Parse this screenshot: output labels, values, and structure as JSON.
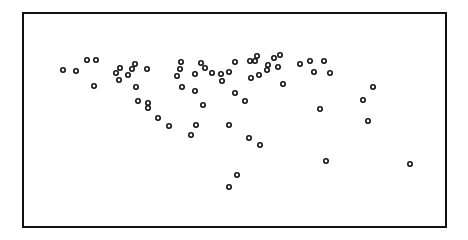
{
  "chart_data": {
    "type": "scatter",
    "title": "",
    "xlabel": "",
    "ylabel": "",
    "grid": false,
    "legend": null,
    "axes_visible": false,
    "frame": {
      "x0": 23,
      "y0": 13,
      "x1": 446,
      "y1": 227,
      "stroke": "#111111",
      "stroke_width": 2
    },
    "marker": {
      "shape": "hollow-circle",
      "radius": 2.2,
      "stroke": "#111111",
      "stroke_width": 1.6,
      "fill": "#ffffff"
    },
    "coordinate_space": "pixel (frame-relative plot, no tick labels shown)",
    "points": [
      {
        "x": 63,
        "y": 70
      },
      {
        "x": 76,
        "y": 71
      },
      {
        "x": 87,
        "y": 60
      },
      {
        "x": 96,
        "y": 60
      },
      {
        "x": 94,
        "y": 86
      },
      {
        "x": 116,
        "y": 73
      },
      {
        "x": 120,
        "y": 68
      },
      {
        "x": 119,
        "y": 80
      },
      {
        "x": 128,
        "y": 75
      },
      {
        "x": 132,
        "y": 69
      },
      {
        "x": 135,
        "y": 64
      },
      {
        "x": 147,
        "y": 69
      },
      {
        "x": 136,
        "y": 87
      },
      {
        "x": 138,
        "y": 101
      },
      {
        "x": 148,
        "y": 103
      },
      {
        "x": 148,
        "y": 108
      },
      {
        "x": 158,
        "y": 118
      },
      {
        "x": 169,
        "y": 126
      },
      {
        "x": 181,
        "y": 62
      },
      {
        "x": 180,
        "y": 69
      },
      {
        "x": 177,
        "y": 76
      },
      {
        "x": 182,
        "y": 87
      },
      {
        "x": 201,
        "y": 63
      },
      {
        "x": 205,
        "y": 68
      },
      {
        "x": 195,
        "y": 74
      },
      {
        "x": 212,
        "y": 73
      },
      {
        "x": 221,
        "y": 74
      },
      {
        "x": 222,
        "y": 81
      },
      {
        "x": 229,
        "y": 72
      },
      {
        "x": 235,
        "y": 62
      },
      {
        "x": 195,
        "y": 91
      },
      {
        "x": 203,
        "y": 105
      },
      {
        "x": 235,
        "y": 93
      },
      {
        "x": 245,
        "y": 101
      },
      {
        "x": 196,
        "y": 125
      },
      {
        "x": 191,
        "y": 135
      },
      {
        "x": 229,
        "y": 125
      },
      {
        "x": 249,
        "y": 138
      },
      {
        "x": 260,
        "y": 145
      },
      {
        "x": 237,
        "y": 175
      },
      {
        "x": 229,
        "y": 187
      },
      {
        "x": 250,
        "y": 61
      },
      {
        "x": 255,
        "y": 61
      },
      {
        "x": 257,
        "y": 56
      },
      {
        "x": 251,
        "y": 78
      },
      {
        "x": 259,
        "y": 75
      },
      {
        "x": 268,
        "y": 65
      },
      {
        "x": 267,
        "y": 70
      },
      {
        "x": 274,
        "y": 58
      },
      {
        "x": 280,
        "y": 55
      },
      {
        "x": 278,
        "y": 67
      },
      {
        "x": 283,
        "y": 84
      },
      {
        "x": 300,
        "y": 64
      },
      {
        "x": 310,
        "y": 61
      },
      {
        "x": 314,
        "y": 72
      },
      {
        "x": 324,
        "y": 61
      },
      {
        "x": 330,
        "y": 73
      },
      {
        "x": 320,
        "y": 109
      },
      {
        "x": 373,
        "y": 87
      },
      {
        "x": 363,
        "y": 100
      },
      {
        "x": 368,
        "y": 121
      },
      {
        "x": 326,
        "y": 161
      },
      {
        "x": 410,
        "y": 164
      }
    ]
  }
}
